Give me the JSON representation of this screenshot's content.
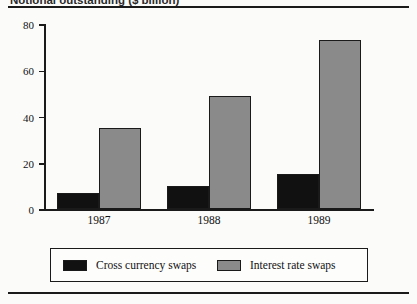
{
  "figure": {
    "caption": "Notional outstanding ($ billion)",
    "caption_truncated": true,
    "top_rule": "horizontal-rule",
    "bottom_rule": "horizontal-rule"
  },
  "chart_data": {
    "type": "bar",
    "title": "",
    "xlabel": "",
    "ylabel": "",
    "categories": [
      "1987",
      "1988",
      "1989"
    ],
    "series": [
      {
        "name": "Cross currency swaps",
        "color": "#111111",
        "values": [
          7,
          10,
          15
        ]
      },
      {
        "name": "Interest rate swaps",
        "color": "#8a8a8a",
        "values": [
          35,
          49,
          73
        ]
      }
    ],
    "ylim": [
      0,
      80
    ],
    "yticks": [
      0,
      20,
      40,
      60,
      80
    ],
    "ytick_labels": [
      "0",
      "20",
      "40",
      "60",
      "80"
    ],
    "grid": false,
    "legend_position": "bottom"
  }
}
